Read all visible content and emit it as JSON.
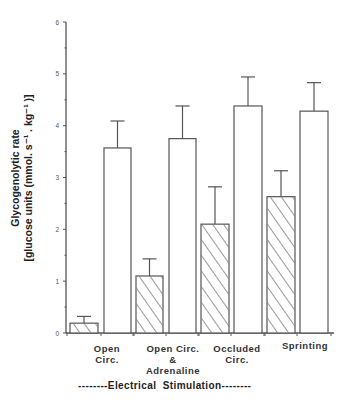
{
  "chart_data": {
    "type": "bar",
    "title": "",
    "xlabel": "--------Electrical  Stimulation--------",
    "ylabel_line1": "Glycogenolytic rate",
    "ylabel_line2": "[glucose units  (mmol. s⁻¹ . kg⁻¹ )]",
    "ylim": [
      0,
      6
    ],
    "yticks": [
      0,
      1,
      2,
      3,
      4,
      5,
      6
    ],
    "grid": false,
    "legend": "none",
    "categories": [
      "Open\nCirc.",
      "Open  Circ.\n&\nAdrenaline",
      "Occluded\nCirc.",
      "Sprinting"
    ],
    "series": [
      {
        "name": "hatched",
        "pattern": "diagonal-hatch",
        "values": [
          0.19,
          1.1,
          2.1,
          2.63
        ],
        "error_upper": [
          0.32,
          1.43,
          2.82,
          3.13
        ]
      },
      {
        "name": "open",
        "pattern": "none",
        "values": [
          3.57,
          3.75,
          4.38,
          4.28
        ],
        "error_upper": [
          4.09,
          4.38,
          4.94,
          4.83
        ]
      }
    ]
  }
}
